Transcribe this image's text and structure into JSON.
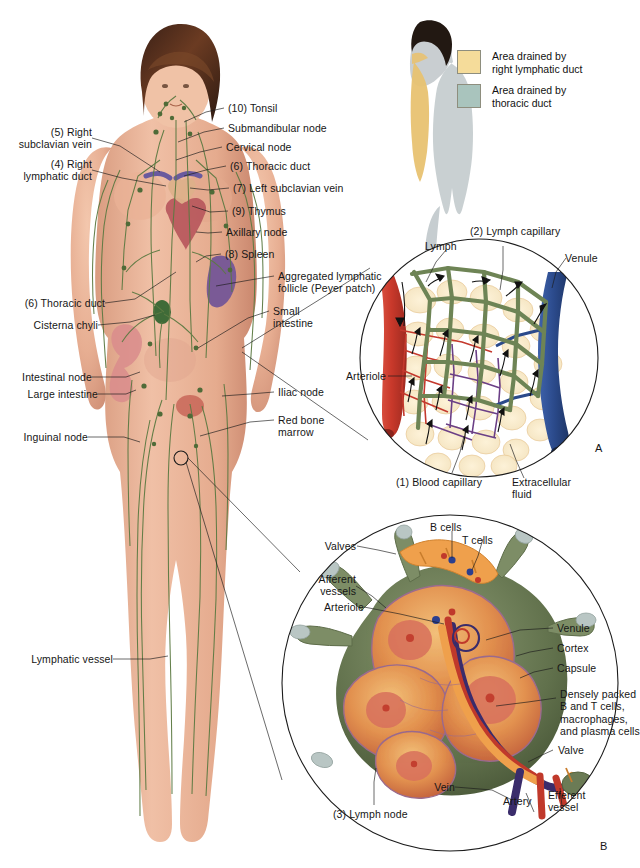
{
  "figure": {
    "panel_letters": {
      "a": "A",
      "b": "B"
    }
  },
  "legend": {
    "items": [
      {
        "label": "Area drained by\nright lymphatic duct",
        "color": "#f5dc9a",
        "name": "right-lymphatic-duct"
      },
      {
        "label": "Area drained by\nthoracic duct",
        "color": "#a9c4bd",
        "name": "thoracic-duct"
      }
    ]
  },
  "body_labels": {
    "left": [
      {
        "id": "right-subclavian-vein",
        "text": "(5) Right\nsubclavian vein"
      },
      {
        "id": "right-lymphatic-duct",
        "text": "(4) Right\nlymphatic duct"
      },
      {
        "id": "thoracic-duct-left",
        "text": "(6) Thoracic duct"
      },
      {
        "id": "cisterna-chyli",
        "text": "Cisterna chyli"
      },
      {
        "id": "intestinal-node",
        "text": "Intestinal node"
      },
      {
        "id": "large-intestine",
        "text": "Large intestine"
      },
      {
        "id": "inguinal-node",
        "text": "Inguinal node"
      },
      {
        "id": "lymphatic-vessel",
        "text": "Lymphatic vessel"
      }
    ],
    "right": [
      {
        "id": "tonsil",
        "text": "(10) Tonsil"
      },
      {
        "id": "submandibular-node",
        "text": "Submandibular node"
      },
      {
        "id": "cervical-node",
        "text": "Cervical node"
      },
      {
        "id": "thoracic-duct-right",
        "text": "(6) Thoracic duct"
      },
      {
        "id": "left-subclavian-vein",
        "text": "(7) Left subclavian vein"
      },
      {
        "id": "thymus",
        "text": "(9) Thymus"
      },
      {
        "id": "axillary-node",
        "text": "Axillary node"
      },
      {
        "id": "spleen",
        "text": "(8) Spleen"
      },
      {
        "id": "peyer-patch",
        "text": "Aggregated lymphatic\nfollicle (Peyer patch)"
      },
      {
        "id": "small-intestine",
        "text": "Small\nintestine"
      },
      {
        "id": "iliac-node",
        "text": "Iliac node"
      },
      {
        "id": "red-bone-marrow",
        "text": "Red bone\nmarrow"
      }
    ]
  },
  "panel_a": {
    "letter": "A",
    "labels": [
      {
        "id": "lymph",
        "text": "Lymph"
      },
      {
        "id": "lymph-capillary",
        "text": "(2) Lymph capillary"
      },
      {
        "id": "venule",
        "text": "Venule"
      },
      {
        "id": "arteriole",
        "text": "Arteriole"
      },
      {
        "id": "blood-capillary",
        "text": "(1) Blood capillary"
      },
      {
        "id": "extracellular-fluid",
        "text": "Extracellular\nfluid"
      }
    ]
  },
  "panel_b": {
    "letter": "B",
    "labels": [
      {
        "id": "b-cells",
        "text": "B cells"
      },
      {
        "id": "t-cells",
        "text": "T cells"
      },
      {
        "id": "valves",
        "text": "Valves"
      },
      {
        "id": "afferent-vessels",
        "text": "Afferent\nvessels"
      },
      {
        "id": "arteriole",
        "text": "Arteriole"
      },
      {
        "id": "venule",
        "text": "Venule"
      },
      {
        "id": "cortex",
        "text": "Cortex"
      },
      {
        "id": "capsule",
        "text": "Capsule"
      },
      {
        "id": "densely-packed",
        "text": "Densely packed\nB and T cells,\nmacrophages,\nand plasma cells"
      },
      {
        "id": "valve",
        "text": "Valve"
      },
      {
        "id": "vein",
        "text": "Vein"
      },
      {
        "id": "artery",
        "text": "Artery"
      },
      {
        "id": "efferent-vessel",
        "text": "Efferent\nvessel"
      },
      {
        "id": "lymph-node",
        "text": "(3) Lymph node"
      }
    ]
  },
  "colors": {
    "lymph_green": "#6e8455",
    "artery_red": "#c0392b",
    "vein_blue": "#2b4a8b",
    "capsule_green": "#6b7b55",
    "cortex_orange": "#e08b45",
    "skin": "#e8b49a",
    "hair": "#4a2a1c"
  }
}
